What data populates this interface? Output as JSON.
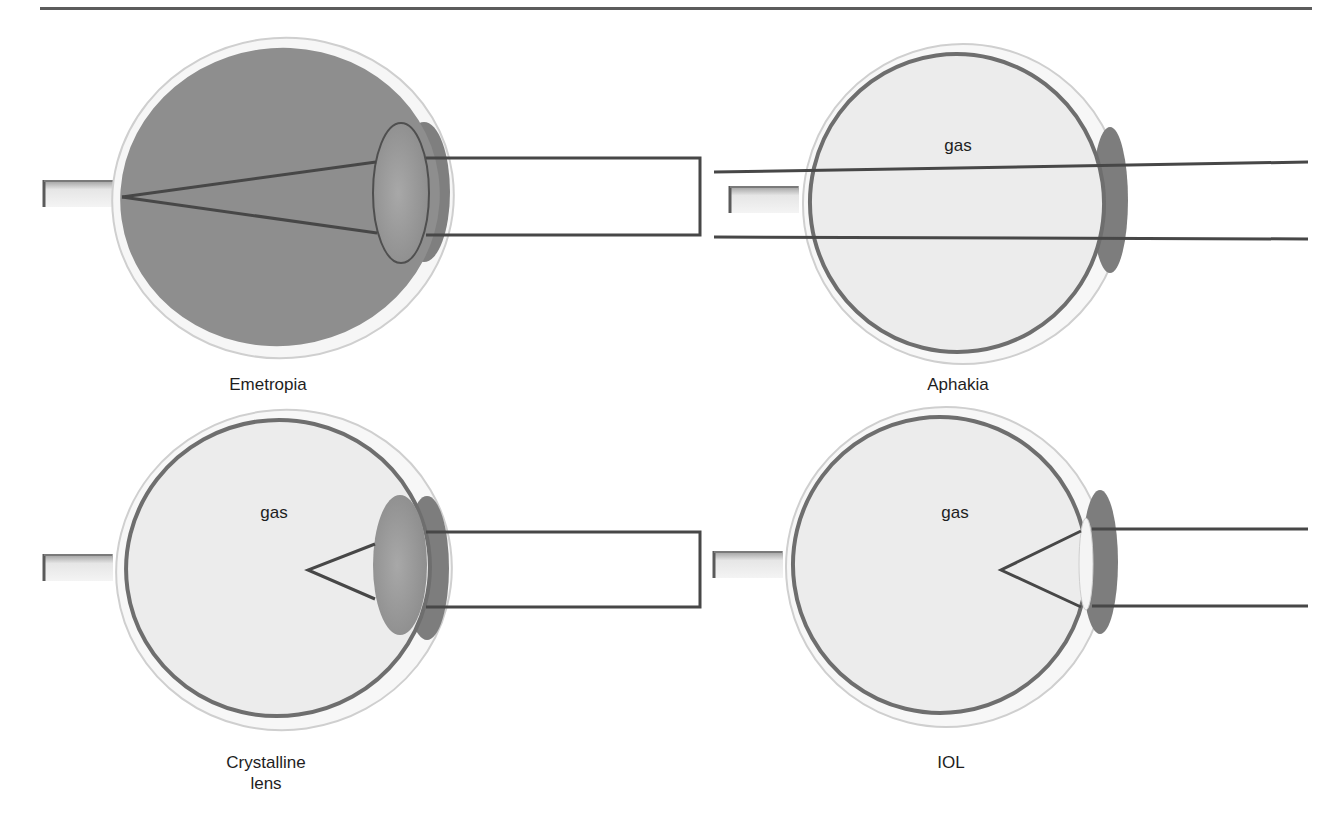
{
  "figure": {
    "top_rule": true,
    "panels": [
      {
        "id": "emetropia",
        "caption": "Emetropia",
        "medium_label": "",
        "eye_fill": "#8e8e8e",
        "lens_type": "crystalline",
        "focus": "retina"
      },
      {
        "id": "aphakia",
        "caption": "Aphakia",
        "medium_label": "gas",
        "eye_fill": "#ececec",
        "lens_type": "none",
        "focus": "none"
      },
      {
        "id": "crystalline-lens",
        "caption": "Crystalline\nlens",
        "medium_label": "gas",
        "eye_fill": "#ececec",
        "lens_type": "crystalline",
        "focus": "anterior"
      },
      {
        "id": "iol",
        "caption": "IOL",
        "medium_label": "gas",
        "eye_fill": "#ececec",
        "lens_type": "iol",
        "focus": "anterior"
      }
    ],
    "colors": {
      "ray": "#474747",
      "retina": "#6e6e6e",
      "sclera_edge": "#c8c8c8",
      "iris": "#7d7d7d",
      "lens": "#9a9a9a",
      "iol": "#f4f4f4"
    }
  }
}
